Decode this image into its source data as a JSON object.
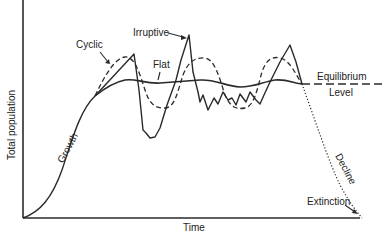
{
  "diagram": {
    "type": "population-growth-patterns",
    "axes": {
      "ylabel": "Total population",
      "xlabel": "Time"
    },
    "curves": [
      {
        "name": "growth",
        "label": "Growth",
        "style": "solid"
      },
      {
        "name": "cyclic",
        "label": "Cyclic",
        "style": "dashed"
      },
      {
        "name": "irruptive",
        "label": "Irruptive",
        "style": "solid-jagged"
      },
      {
        "name": "flat",
        "label": "Flat",
        "style": "solid"
      },
      {
        "name": "decline",
        "label": "Decline",
        "style": "dotted"
      }
    ],
    "labels": {
      "cyclic": "Cyclic",
      "irruptive": "Irruptive",
      "flat": "Flat",
      "growth": "Growth",
      "equilibrium": "Equilibrium",
      "level": "Level",
      "decline": "Decline",
      "extinction": "Extinction"
    },
    "colors": {
      "line": "#2a2a2a",
      "background": "#ffffff"
    }
  }
}
